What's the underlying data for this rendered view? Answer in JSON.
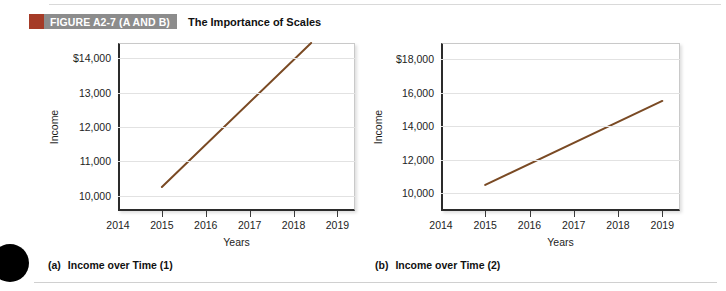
{
  "figure": {
    "tag": "FIGURE A2-7 (A AND B)",
    "title": "The Importance of Scales",
    "swatch_color": "#a53b27",
    "band_color": "#8c8c8c"
  },
  "panels": [
    {
      "caption_tag": "(a)",
      "caption_text": "Income over Time (1)"
    },
    {
      "caption_tag": "(b)",
      "caption_text": "Income over Time (2)"
    }
  ],
  "chart_data": [
    {
      "type": "line",
      "title": "Income over Time (1)",
      "xlabel": "Years",
      "ylabel": "Income",
      "series": [
        {
          "name": "Income",
          "x": [
            2015,
            2018.4
          ],
          "values": [
            10250,
            14450
          ]
        }
      ],
      "line_color": "#7a4a24",
      "xlim": [
        2014,
        2019.4
      ],
      "ylim": [
        9550,
        14450
      ],
      "xticks": [
        2014,
        2015,
        2016,
        2017,
        2018,
        2019
      ],
      "xtick_labels": [
        "2014",
        "2015",
        "2016",
        "2017",
        "2018",
        "2019"
      ],
      "yticks": [
        10000,
        11000,
        12000,
        13000,
        14000
      ],
      "ytick_labels": [
        "10,000",
        "11,000",
        "12,000",
        "13,000",
        "$14,000"
      ],
      "grid": true,
      "legend": "none"
    },
    {
      "type": "line",
      "title": "Income over Time (2)",
      "xlabel": "Years",
      "ylabel": "Income",
      "series": [
        {
          "name": "Income",
          "x": [
            2015,
            2019
          ],
          "values": [
            10500,
            15500
          ]
        }
      ],
      "line_color": "#7a4a24",
      "xlim": [
        2014,
        2019.4
      ],
      "ylim": [
        8950,
        18950
      ],
      "xticks": [
        2014,
        2015,
        2016,
        2017,
        2018,
        2019
      ],
      "xtick_labels": [
        "2014",
        "2015",
        "2016",
        "2017",
        "2018",
        "2019"
      ],
      "yticks": [
        10000,
        12000,
        14000,
        16000,
        18000
      ],
      "ytick_labels": [
        "10,000",
        "12,000",
        "14,000",
        "16,000",
        "$18,000"
      ],
      "grid": true,
      "legend": "none"
    }
  ]
}
